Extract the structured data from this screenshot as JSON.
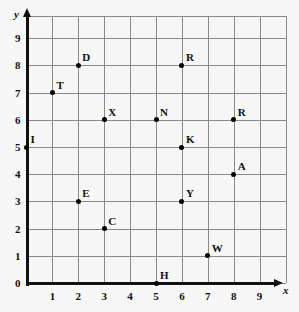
{
  "chart_data": {
    "type": "scatter",
    "title": "",
    "xlabel": "x",
    "ylabel": "y",
    "xlim": [
      0,
      9
    ],
    "ylim": [
      0,
      9
    ],
    "grid": true,
    "legend": "none",
    "x_ticks": [
      "1",
      "2",
      "3",
      "4",
      "5",
      "6",
      "7",
      "8",
      "9"
    ],
    "y_ticks": [
      "0",
      "1",
      "2",
      "3",
      "4",
      "5",
      "6",
      "7",
      "8",
      "9"
    ],
    "point_labels": [
      "D",
      "T",
      "X",
      "I",
      "R",
      "N",
      "R",
      "K",
      "A",
      "E",
      "Y",
      "C",
      "W",
      "H"
    ],
    "points": [
      {
        "label": "D",
        "x": 2,
        "y": 8
      },
      {
        "label": "T",
        "x": 1,
        "y": 7
      },
      {
        "label": "X",
        "x": 3,
        "y": 6
      },
      {
        "label": "I",
        "x": 0,
        "y": 5
      },
      {
        "label": "R",
        "x": 6,
        "y": 8
      },
      {
        "label": "N",
        "x": 5,
        "y": 6
      },
      {
        "label": "R",
        "x": 8,
        "y": 6
      },
      {
        "label": "K",
        "x": 6,
        "y": 5
      },
      {
        "label": "A",
        "x": 8,
        "y": 4
      },
      {
        "label": "E",
        "x": 2,
        "y": 3
      },
      {
        "label": "Y",
        "x": 6,
        "y": 3
      },
      {
        "label": "C",
        "x": 3,
        "y": 2
      },
      {
        "label": "W",
        "x": 7,
        "y": 1
      },
      {
        "label": "H",
        "x": 5,
        "y": 0
      }
    ]
  },
  "colors": {
    "grid": "#8a8a8a",
    "axis": "#111111",
    "point": "#000000",
    "background": "#f7f7f7"
  }
}
